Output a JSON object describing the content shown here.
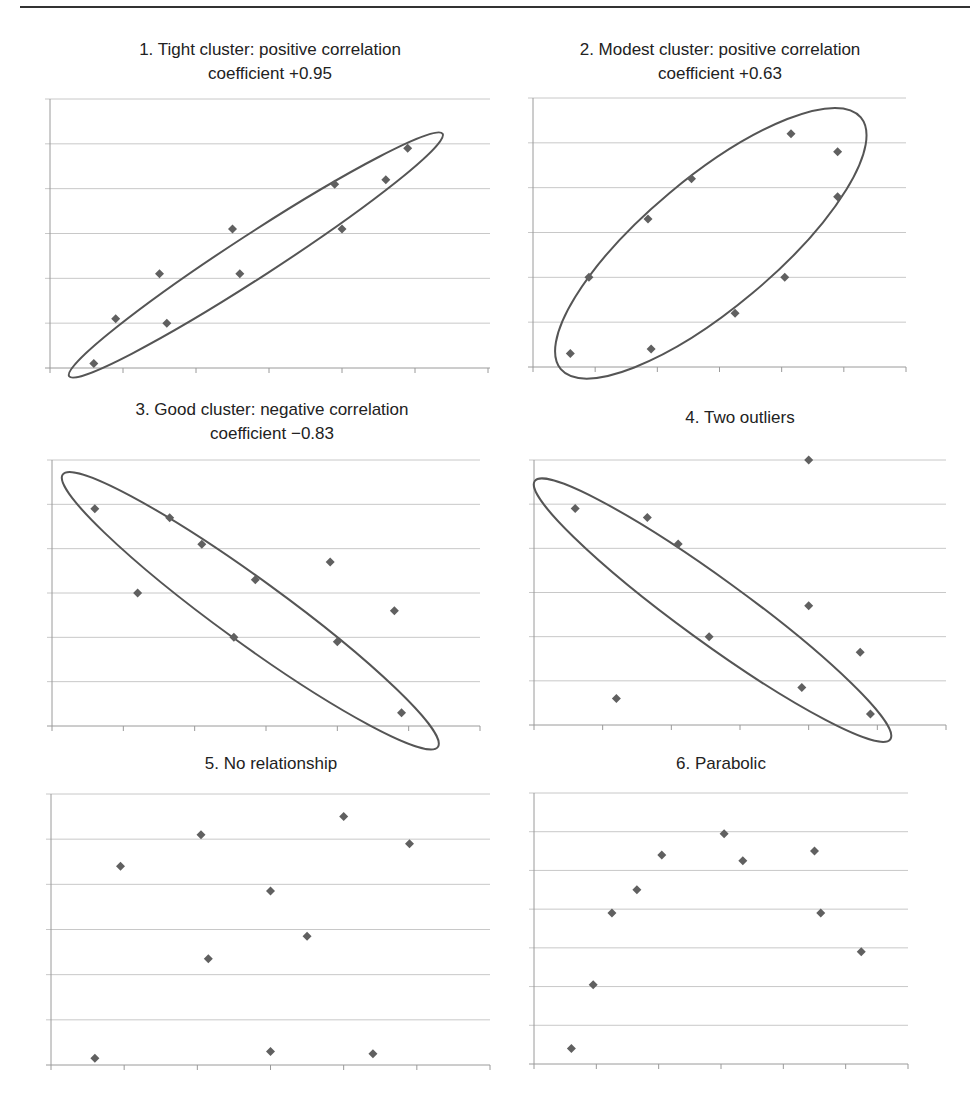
{
  "page": {
    "top_rule": true
  },
  "style": {
    "marker_color": "#606060",
    "grid_color": "#c8c8c8",
    "axis_color": "#9a9a9a",
    "ellipse_color": "#555555"
  },
  "chart_data": [
    {
      "type": "scatter",
      "title": "1. Tight cluster: positive correlation coefficient +0.95",
      "title_lines": [
        "1. Tight cluster: positive correlation",
        "coefficient +0.95"
      ],
      "xlabel": "",
      "ylabel": "",
      "xlim": [
        0,
        6
      ],
      "ylim": [
        0,
        6
      ],
      "grid": true,
      "legend": "none",
      "points": [
        [
          0.6,
          0.1
        ],
        [
          0.9,
          1.1
        ],
        [
          1.5,
          2.1
        ],
        [
          1.6,
          1.0
        ],
        [
          2.5,
          3.1
        ],
        [
          2.6,
          2.1
        ],
        [
          3.9,
          4.1
        ],
        [
          4.0,
          3.1
        ],
        [
          4.6,
          4.2
        ],
        [
          4.9,
          4.9
        ]
      ],
      "ellipse": {
        "cx": 2.82,
        "cy": 2.52,
        "rx": 3.05,
        "ry": 0.48,
        "angle_deg": -33
      }
    },
    {
      "type": "scatter",
      "title": "2. Modest cluster: positive correlation coefficient +0.63",
      "title_lines": [
        "2. Modest cluster: positive correlation",
        "coefficient +0.63"
      ],
      "xlabel": "",
      "ylabel": "",
      "xlim": [
        0,
        6
      ],
      "ylim": [
        0,
        6
      ],
      "grid": true,
      "legend": "none",
      "points": [
        [
          0.6,
          0.3
        ],
        [
          0.9,
          2.0
        ],
        [
          1.9,
          0.4
        ],
        [
          1.85,
          3.3
        ],
        [
          2.55,
          4.2
        ],
        [
          3.25,
          1.2
        ],
        [
          4.05,
          2.0
        ],
        [
          4.15,
          5.2
        ],
        [
          4.9,
          4.8
        ],
        [
          4.9,
          3.8
        ]
      ],
      "ellipse": {
        "cx": 2.86,
        "cy": 2.76,
        "rx": 3.15,
        "ry": 1.45,
        "angle_deg": -40
      }
    },
    {
      "type": "scatter",
      "title": "3. Good cluster: negative correlation coefficient −0.83",
      "title_lines": [
        "3. Good cluster: negative correlation",
        "coefficient −0.83"
      ],
      "xlabel": "",
      "ylabel": "",
      "xlim": [
        0,
        6
      ],
      "ylim": [
        0,
        6
      ],
      "grid": true,
      "legend": "none",
      "points": [
        [
          0.6,
          4.9
        ],
        [
          1.2,
          3.0
        ],
        [
          1.65,
          4.7
        ],
        [
          2.1,
          4.1
        ],
        [
          2.55,
          2.0
        ],
        [
          2.85,
          3.3
        ],
        [
          4.0,
          1.9
        ],
        [
          3.9,
          3.7
        ],
        [
          4.8,
          2.6
        ],
        [
          4.9,
          0.3
        ]
      ],
      "ellipse": {
        "cx": 2.78,
        "cy": 2.6,
        "rx": 3.25,
        "ry": 0.72,
        "angle_deg": 36
      }
    },
    {
      "type": "scatter",
      "title": "4. Two outliers",
      "title_lines": [
        "4. Two outliers"
      ],
      "xlabel": "",
      "ylabel": "",
      "xlim": [
        0,
        6
      ],
      "ylim": [
        0,
        6
      ],
      "grid": true,
      "legend": "none",
      "points": [
        [
          0.6,
          4.9
        ],
        [
          1.2,
          0.6
        ],
        [
          1.65,
          4.7
        ],
        [
          2.1,
          4.1
        ],
        [
          2.55,
          2.0
        ],
        [
          3.9,
          0.85
        ],
        [
          4.0,
          6.0
        ],
        [
          4.0,
          2.7
        ],
        [
          4.75,
          1.65
        ],
        [
          4.9,
          0.25
        ]
      ],
      "outliers": [
        [
          1.2,
          0.6
        ],
        [
          4.0,
          6.0
        ]
      ],
      "ellipse": {
        "cx": 2.6,
        "cy": 2.6,
        "rx": 3.2,
        "ry": 0.72,
        "angle_deg": 36
      }
    },
    {
      "type": "scatter",
      "title": "5. No relationship",
      "title_lines": [
        "5. No relationship"
      ],
      "xlabel": "",
      "ylabel": "",
      "xlim": [
        0,
        6
      ],
      "ylim": [
        0,
        6
      ],
      "grid": true,
      "legend": "none",
      "points": [
        [
          0.6,
          0.15
        ],
        [
          0.95,
          4.4
        ],
        [
          2.05,
          5.1
        ],
        [
          2.15,
          2.35
        ],
        [
          3.0,
          3.85
        ],
        [
          3.0,
          0.3
        ],
        [
          3.5,
          2.85
        ],
        [
          4.0,
          5.5
        ],
        [
          4.4,
          0.25
        ],
        [
          4.9,
          4.9
        ]
      ]
    },
    {
      "type": "scatter",
      "title": "6. Parabolic",
      "title_lines": [
        "6. Parabolic"
      ],
      "xlabel": "",
      "ylabel": "",
      "xlim": [
        0,
        6
      ],
      "ylim": [
        0,
        7
      ],
      "grid": true,
      "legend": "none",
      "points": [
        [
          0.6,
          0.4
        ],
        [
          0.95,
          2.05
        ],
        [
          1.25,
          3.9
        ],
        [
          1.65,
          4.5
        ],
        [
          2.05,
          5.4
        ],
        [
          3.05,
          5.95
        ],
        [
          3.35,
          5.25
        ],
        [
          4.5,
          5.5
        ],
        [
          4.6,
          3.9
        ],
        [
          5.25,
          2.9
        ]
      ]
    }
  ],
  "layout": [
    {
      "title_x": 50,
      "title_y": 38,
      "title_w": 440,
      "x0": 50,
      "y0": 99,
      "x1": 488,
      "y1": 368,
      "grid_right": 490
    },
    {
      "title_x": 530,
      "title_y": 38,
      "title_w": 380,
      "x0": 533,
      "y0": 98,
      "x1": 906,
      "y1": 367,
      "grid_right": 906
    },
    {
      "title_x": 52,
      "title_y": 398,
      "title_w": 440,
      "x0": 52,
      "y0": 460,
      "x1": 480,
      "y1": 726,
      "grid_right": 480
    },
    {
      "title_x": 534,
      "title_y": 398,
      "title_w": 412,
      "x0": 534,
      "y0": 460,
      "x1": 946,
      "y1": 725,
      "grid_right": 946
    },
    {
      "title_x": 51,
      "title_y": 752,
      "title_w": 440,
      "x0": 51,
      "y0": 794,
      "x1": 490,
      "y1": 1065,
      "grid_right": 490
    },
    {
      "title_x": 534,
      "title_y": 752,
      "title_w": 374,
      "x0": 534,
      "y0": 793,
      "x1": 908,
      "y1": 1064,
      "grid_right": 908
    }
  ]
}
